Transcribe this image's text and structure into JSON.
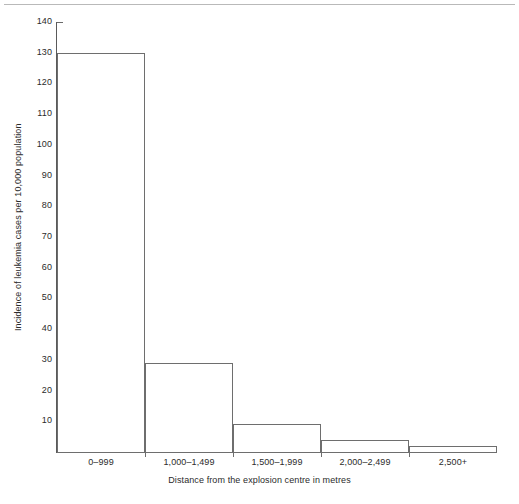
{
  "chart_data": {
    "type": "bar",
    "title": "",
    "subtitle": "",
    "xlabel": "Distance from the explosion centre in metres",
    "ylabel": "Incidence of leukemia cases per 10,000 population",
    "categories": [
      "0–999",
      "1,000–1,499",
      "1,500–1,999",
      "2,000–2,499",
      "2,500+"
    ],
    "values": [
      130,
      29,
      9,
      4,
      2
    ],
    "ylim": [
      0,
      140
    ],
    "ytick_values": [
      0,
      10,
      20,
      30,
      40,
      50,
      60,
      70,
      80,
      90,
      100,
      110,
      120,
      130,
      140
    ],
    "ytick_labels": [
      "",
      "10",
      "20",
      "30",
      "40",
      "50",
      "60",
      "70",
      "80",
      "90",
      "100",
      "110",
      "120",
      "130",
      "140"
    ],
    "grid": false,
    "legend": null,
    "legend_position": "none",
    "bar_style": {
      "fill": "#ffffff",
      "edge": "#6e6e6e",
      "gap": 0
    },
    "axis_color": "#5a5a5a",
    "text_color": "#2b2b2b",
    "background": "#ffffff"
  },
  "decor": {
    "top_rule_color": "#b9b9b9"
  }
}
